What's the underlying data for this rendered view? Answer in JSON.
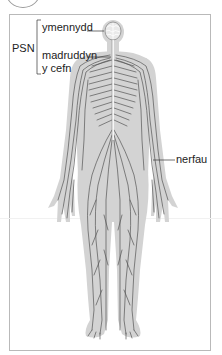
{
  "diagram": {
    "type": "labelled anatomical illustration",
    "group_label": "PSN",
    "labels": [
      {
        "id": "brain",
        "text": "ymennydd"
      },
      {
        "id": "spinal-cord-line1",
        "text": "madruddyn"
      },
      {
        "id": "spinal-cord-line2",
        "text": "y cefn"
      },
      {
        "id": "nerves",
        "text": "nerfau"
      }
    ],
    "colors": {
      "body_fill": "#d3d3d3",
      "nerve_stroke": "#555555",
      "spine_stroke": "#ffffff",
      "frame": "#b9b9b9",
      "text": "#222222"
    }
  }
}
